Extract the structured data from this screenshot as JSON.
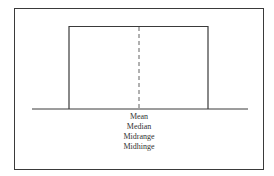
{
  "diagram": {
    "type": "uniform-distribution",
    "center_labels": [
      "Mean",
      "Median",
      "Midrange",
      "Midhinge"
    ],
    "colors": {
      "line": "#3a3a3a",
      "frame": "#3a3a3a",
      "background": "#ffffff"
    }
  }
}
